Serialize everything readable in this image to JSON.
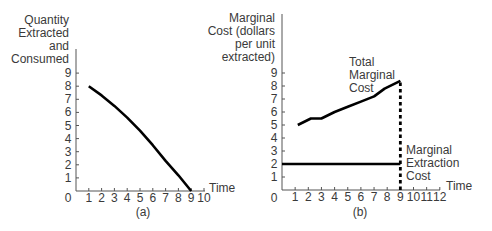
{
  "chart_data": [
    {
      "id": "a",
      "type": "line",
      "caption": "(a)",
      "title": "",
      "ylabel": [
        "Quantity",
        "Extracted",
        "and",
        "Consumed"
      ],
      "xlabel": "Time",
      "x_ticks": [
        "1",
        "2",
        "3",
        "4",
        "5",
        "6",
        "7",
        "8",
        "9",
        "10"
      ],
      "y_ticks": [
        "1",
        "2",
        "3",
        "4",
        "5",
        "6",
        "7",
        "8",
        "9"
      ],
      "origin_label": "0",
      "xlim": [
        0,
        10
      ],
      "ylim": [
        0,
        9
      ],
      "grid": false,
      "series": [
        {
          "name": "Quantity Extracted and Consumed",
          "x": [
            1,
            2,
            3,
            4,
            5,
            6,
            7,
            8,
            9
          ],
          "y": [
            8.0,
            7.3,
            6.5,
            5.6,
            4.6,
            3.5,
            2.3,
            1.2,
            0.0
          ]
        }
      ]
    },
    {
      "id": "b",
      "type": "line",
      "caption": "(b)",
      "title": "",
      "ylabel": [
        "Marginal",
        "Cost (dollars",
        "per unit",
        "extracted)"
      ],
      "xlabel": "Time",
      "x_ticks": [
        "1",
        "2",
        "3",
        "4",
        "5",
        "6",
        "7",
        "8",
        "9",
        "10",
        "11",
        "12"
      ],
      "y_ticks": [
        "1",
        "2",
        "3",
        "4",
        "5",
        "6",
        "7",
        "8",
        "9"
      ],
      "origin_label": "0",
      "xlim": [
        0,
        12
      ],
      "ylim": [
        0,
        9
      ],
      "grid": false,
      "series": [
        {
          "name": "Total Marginal Cost",
          "x": [
            1.2,
            2.2,
            3,
            4,
            5,
            6,
            7,
            7.8,
            9
          ],
          "y": [
            5.0,
            5.5,
            5.5,
            6.0,
            6.4,
            6.8,
            7.2,
            7.8,
            8.4
          ]
        },
        {
          "name": "Marginal Extraction Cost",
          "x": [
            0,
            9
          ],
          "y": [
            2.0,
            2.0
          ]
        }
      ],
      "annotations": [
        {
          "text": [
            "Total",
            "Marginal",
            "Cost"
          ],
          "near": "Total Marginal Cost curve"
        },
        {
          "text": [
            "Marginal",
            "Extraction",
            "Cost"
          ],
          "near": "Marginal Extraction Cost line"
        },
        {
          "type": "vertical-dotted-line",
          "x": 9,
          "from": 0,
          "to": 8.4
        }
      ]
    }
  ]
}
